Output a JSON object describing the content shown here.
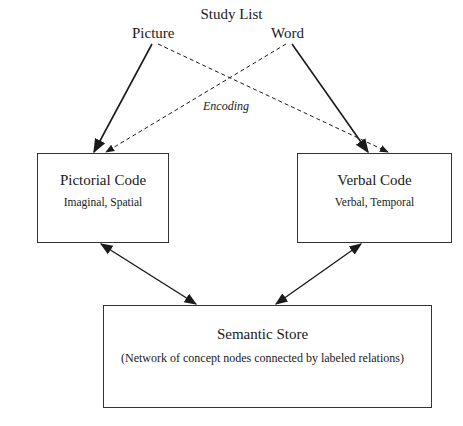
{
  "header": {
    "title": "Study List"
  },
  "inputs": [
    {
      "id": "picture",
      "label": "Picture"
    },
    {
      "id": "word",
      "label": "Word"
    }
  ],
  "edge_label": "Encoding",
  "nodes": {
    "pictorial": {
      "title": "Pictorial Code",
      "subtitle": "Imaginal, Spatial"
    },
    "verbal": {
      "title": "Verbal Code",
      "subtitle": "Verbal, Temporal"
    },
    "semantic": {
      "title": "Semantic Store",
      "description": "(Network of concept nodes connected by labeled relations)"
    }
  },
  "edges": [
    {
      "from": "Picture",
      "to": "Pictorial Code",
      "style": "solid",
      "direction": "forward"
    },
    {
      "from": "Picture",
      "to": "Verbal Code",
      "style": "dashed",
      "direction": "forward"
    },
    {
      "from": "Word",
      "to": "Verbal Code",
      "style": "solid",
      "direction": "forward"
    },
    {
      "from": "Word",
      "to": "Pictorial Code",
      "style": "dashed",
      "direction": "forward"
    },
    {
      "from": "Pictorial Code",
      "to": "Semantic Store",
      "style": "solid",
      "direction": "both"
    },
    {
      "from": "Verbal Code",
      "to": "Semantic Store",
      "style": "solid",
      "direction": "both"
    }
  ],
  "colors": {
    "line": "#1a1a1a",
    "background": "#ffffff"
  }
}
